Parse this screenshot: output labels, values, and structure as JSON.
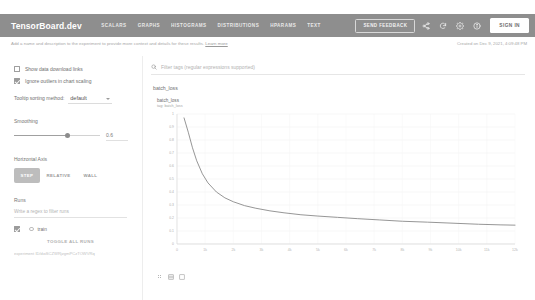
{
  "header": {
    "brand": "TensorBoard.dev",
    "nav": [
      {
        "label": "SCALARS"
      },
      {
        "label": "GRAPHS"
      },
      {
        "label": "HISTOGRAMS"
      },
      {
        "label": "DISTRIBUTIONS"
      },
      {
        "label": "HPARAMS"
      },
      {
        "label": "TEXT"
      }
    ],
    "feedback_label": "SEND FEEDBACK",
    "signin_label": "SIGN IN",
    "icons": [
      "share-icon",
      "refresh-icon",
      "settings-gear-icon",
      "info-circle-icon"
    ],
    "bar_color": "#8e8e8e"
  },
  "subbar": {
    "description": "Add a name and description to the experiment to provide more context and details for these results.",
    "learn_more": "Learn more",
    "created": "Created on Dec 9, 2021, 4:09:48 PM"
  },
  "sidebar": {
    "show_download_links": {
      "label": "Show data download links",
      "checked": false
    },
    "ignore_outliers": {
      "label": "Ignore outliers in chart scaling",
      "checked": true
    },
    "tooltip_sorting": {
      "label": "Tooltip sorting method:",
      "value": "default"
    },
    "smoothing": {
      "label": "Smoothing",
      "value": "0.6"
    },
    "horizontal_axis": {
      "label": "Horizontal Axis",
      "options": [
        {
          "label": "STEP",
          "selected": true
        },
        {
          "label": "RELATIVE",
          "selected": false
        },
        {
          "label": "WALL",
          "selected": false
        }
      ]
    },
    "runs": {
      "label": "Runs",
      "filter_placeholder": "Write a regex to filter runs",
      "items": [
        {
          "name": "train",
          "checked": true
        }
      ],
      "toggle_all_label": "TOGGLE ALL RUNS",
      "experiment_id": "experiment ID/dwSCZWRjzgmPCzTOWVRq"
    }
  },
  "main": {
    "filter_placeholder": "Filter tags (regular expressions supported)",
    "group_label": "batch_loss"
  },
  "chart_data": {
    "type": "line",
    "title": "batch_loss",
    "subtitle": "tag: batch_loss",
    "xlabel": "",
    "ylabel": "",
    "grid": true,
    "legend": "none",
    "series_name": "train",
    "line_color": "#8a8a8a",
    "xlim": [
      0,
      12000
    ],
    "ylim": [
      0.0,
      1.0
    ],
    "xticks": [
      "0",
      "1k",
      "2k",
      "3k",
      "4k",
      "5k",
      "6k",
      "7k",
      "8k",
      "9k",
      "10k",
      "11k",
      "12k"
    ],
    "xtick_values": [
      0,
      1000,
      2000,
      3000,
      4000,
      5000,
      6000,
      7000,
      8000,
      9000,
      10000,
      11000,
      12000
    ],
    "yticks": [
      "1",
      "0.9",
      "0.8",
      "0.7",
      "0.6",
      "0.5",
      "0.4",
      "0.3",
      "0.2",
      "0.1",
      "0"
    ],
    "ytick_values": [
      1.0,
      0.9,
      0.8,
      0.7,
      0.6,
      0.5,
      0.4,
      0.3,
      0.2,
      0.1,
      0.0
    ],
    "x": [
      250,
      400,
      550,
      700,
      900,
      1100,
      1400,
      1700,
      2000,
      2400,
      2800,
      3300,
      3800,
      4400,
      5000,
      5700,
      6400,
      7200,
      8000,
      8900,
      9800,
      10700,
      11500,
      12000
    ],
    "y": [
      0.97,
      0.86,
      0.74,
      0.64,
      0.54,
      0.47,
      0.4,
      0.355,
      0.325,
      0.295,
      0.275,
      0.255,
      0.24,
      0.225,
      0.215,
      0.205,
      0.195,
      0.185,
      0.175,
      0.168,
      0.16,
      0.152,
      0.147,
      0.145
    ]
  }
}
